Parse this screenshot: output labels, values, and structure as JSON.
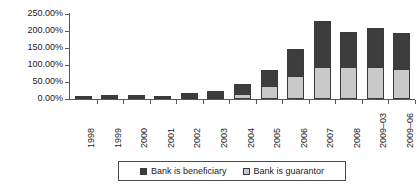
{
  "chart_data": {
    "type": "bar",
    "subtype": "stacked-bar",
    "title": "",
    "xlabel": "",
    "ylabel": "",
    "categories": [
      "1998",
      "1999",
      "2000",
      "2001",
      "2002",
      "2003",
      "2004",
      "2005",
      "2006",
      "2007",
      "2008",
      "2009–03",
      "2009–06"
    ],
    "series": [
      {
        "name": "Bank is guarantor",
        "color": "#c9c9c9",
        "values": [
          1.0,
          2.0,
          2.0,
          1.5,
          3.0,
          3.0,
          16.0,
          37.0,
          67.0,
          94.0,
          94.0,
          94.0,
          89.0
        ]
      },
      {
        "name": "Bank is beneficiary",
        "color": "#3d3d3d",
        "values": [
          3.0,
          5.0,
          6.0,
          4.0,
          12.0,
          17.0,
          29.0,
          48.0,
          80.0,
          135.0,
          104.0,
          114.0,
          104.0
        ]
      }
    ],
    "totals": [
      4.0,
      7.0,
      8.0,
      5.5,
      15.0,
      20.0,
      45.0,
      85.0,
      147.0,
      229.0,
      198.0,
      208.0,
      193.0
    ],
    "ylim": [
      0,
      250
    ],
    "ytick_values": [
      0,
      50,
      100,
      150,
      200,
      250
    ],
    "ytick_labels": [
      "0.00%",
      "50.00%",
      "100.00%",
      "150.00%",
      "200.00%",
      "250.00%"
    ],
    "ytick_labels_reversed": [
      "250.00%",
      "200.00%",
      "150.00%",
      "100.00%",
      "50.00%",
      "0.00%"
    ],
    "grid": false,
    "legend_position": "bottom",
    "legend_entries": [
      {
        "label": "Bank is beneficiary",
        "color": "#3d3d3d"
      },
      {
        "label": "Bank is guarantor",
        "color": "#c9c9c9"
      }
    ],
    "axis_color": "#5a5a5a",
    "background": "#ffffff"
  }
}
